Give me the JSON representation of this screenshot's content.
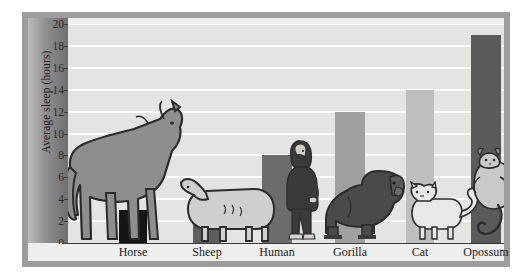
{
  "chart_data": {
    "type": "bar",
    "title": "",
    "xlabel": "",
    "ylabel": "Average sleep (hours)",
    "ylim": [
      0,
      20
    ],
    "ytick_step": 2,
    "yticks": [
      "0",
      "2",
      "4",
      "6",
      "8",
      "10",
      "12",
      "14",
      "16",
      "18",
      "20"
    ],
    "grid": true,
    "legend": "none",
    "categories": [
      "Horse",
      "Sheep",
      "Human",
      "Gorilla",
      "Cat",
      "Opossum"
    ],
    "values": [
      3,
      4,
      8,
      12,
      14,
      19
    ],
    "bar_colors": [
      "#151515",
      "#5e5e5e",
      "#6c6c6c",
      "#a0a0a0",
      "#bebebe",
      "#5a5a5a"
    ],
    "series": [
      {
        "name": "Average sleep (hours)",
        "values": [
          3,
          4,
          8,
          12,
          14,
          19
        ]
      }
    ],
    "points": [
      {
        "category": "Horse",
        "value": 3,
        "color": "#151515",
        "animal": "horse-silhouette"
      },
      {
        "category": "Sheep",
        "value": 4,
        "color": "#5e5e5e",
        "animal": "sheep-silhouette"
      },
      {
        "category": "Human",
        "value": 8,
        "color": "#6c6c6c",
        "animal": "human-silhouette"
      },
      {
        "category": "Gorilla",
        "value": 12,
        "color": "#a0a0a0",
        "animal": "gorilla-silhouette"
      },
      {
        "category": "Cat",
        "value": 14,
        "color": "#bebebe",
        "animal": "cat-silhouette"
      },
      {
        "category": "Opossum",
        "value": 19,
        "color": "#5a5a5a",
        "animal": "opossum-silhouette"
      }
    ]
  },
  "axis": {
    "y_title": "Average sleep (hours)"
  },
  "colors": {
    "frame": "#9d9d9d",
    "panel": "#efefed",
    "plot_background": "#e4e4e2",
    "gridline": "#fbfbfa",
    "axis_band_dark": "#6f6f6f",
    "axis_line": "#3a3a3a",
    "text": "#1b1b1b",
    "animal_fill": "#8e8e8e",
    "animal_outline": "#2b2b2b"
  }
}
